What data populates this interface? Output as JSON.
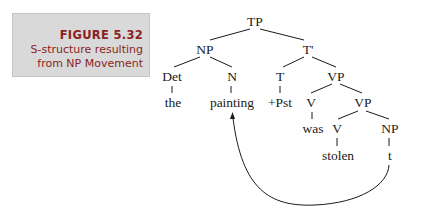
{
  "caption": {
    "label": "FIGURE 5.32",
    "title_line1": "S-structure resulting",
    "title_line2": "from NP Movement",
    "color": "#8a1f24",
    "box_color": "#d9d9d9"
  },
  "tree": {
    "nodes": {
      "tp": "TP",
      "np_subject": "NP",
      "t_bar": "T'",
      "det": "Det",
      "n": "N",
      "t": "T",
      "vp_top": "VP",
      "word_the": "the",
      "word_painting": "painting",
      "word_pst": "+Pst",
      "v_aux": "V",
      "vp_lower": "VP",
      "word_was": "was",
      "v_main": "V",
      "np_object": "NP",
      "word_stolen": "stolen",
      "trace": "t"
    },
    "movement_arrow": {
      "from": "t",
      "to": "painting"
    }
  }
}
